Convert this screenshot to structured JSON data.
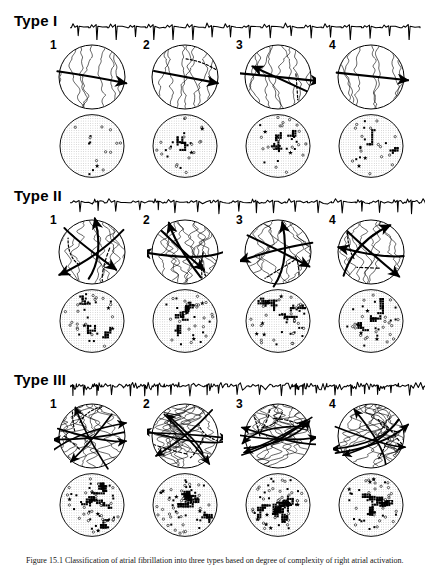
{
  "figure": {
    "caption_prefix": "Figure 15.1",
    "caption_text": "Figure 15.1  Classification of atrial fibrillation into three types based on degree of complexity of right atrial activation."
  },
  "types": [
    {
      "id": "type-1",
      "label": "Type I",
      "ecg": {
        "name": "ecg-type-1",
        "description": "regular coarse fibrillation waves, uniform morphology",
        "beats": 18,
        "amplitude": 0.85,
        "irregularity": 0.08,
        "noise": 0.05
      },
      "activation_panels": [
        {
          "number": "1",
          "pattern": "single-broad-wavefront",
          "isochrones": 7,
          "arrows": 1,
          "block_lines": 0
        },
        {
          "number": "2",
          "pattern": "single-wavefront-with-arc-of-block",
          "isochrones": 8,
          "arrows": 1,
          "block_lines": 1
        },
        {
          "number": "3",
          "pattern": "two-wavefronts-colliding",
          "isochrones": 8,
          "arrows": 2,
          "block_lines": 1
        },
        {
          "number": "4",
          "pattern": "single-uniform-wavefront",
          "isochrones": 7,
          "arrows": 1,
          "block_lines": 0
        }
      ],
      "map_panels": [
        {
          "number": "1",
          "density": 0.06,
          "clusters": 0,
          "stars": 1
        },
        {
          "number": "2",
          "density": 0.22,
          "clusters": 2,
          "stars": 2
        },
        {
          "number": "3",
          "density": 0.3,
          "clusters": 3,
          "stars": 2
        },
        {
          "number": "4",
          "density": 0.2,
          "clusters": 2,
          "stars": 2
        }
      ]
    },
    {
      "id": "type-2",
      "label": "Type II",
      "ecg": {
        "name": "ecg-type-2",
        "description": "fibrillation waves of varying morphology and cycle length",
        "beats": 20,
        "amplitude": 0.72,
        "irregularity": 0.38,
        "noise": 0.18
      },
      "activation_panels": [
        {
          "number": "1",
          "pattern": "two-wavelets-with-block-arc",
          "isochrones": 10,
          "arrows": 3,
          "block_lines": 2
        },
        {
          "number": "2",
          "pattern": "wavefront-with-reentry",
          "isochrones": 11,
          "arrows": 3,
          "block_lines": 2
        },
        {
          "number": "3",
          "pattern": "two-separate-wavelets",
          "isochrones": 11,
          "arrows": 3,
          "block_lines": 2
        },
        {
          "number": "4",
          "pattern": "wavefront-with-slow-conduction-zone",
          "isochrones": 10,
          "arrows": 3,
          "block_lines": 2
        }
      ],
      "map_panels": [
        {
          "number": "1",
          "density": 0.3,
          "clusters": 3,
          "stars": 3
        },
        {
          "number": "2",
          "density": 0.36,
          "clusters": 4,
          "stars": 3
        },
        {
          "number": "3",
          "density": 0.42,
          "clusters": 4,
          "stars": 4
        },
        {
          "number": "4",
          "density": 0.38,
          "clusters": 3,
          "stars": 3
        }
      ]
    },
    {
      "id": "type-3",
      "label": "Type III",
      "ecg": {
        "name": "ecg-type-3",
        "description": "highly fragmented fibrillation waves, no discrete baseline",
        "beats": 24,
        "amplitude": 0.6,
        "irregularity": 0.72,
        "noise": 0.45
      },
      "activation_panels": [
        {
          "number": "1",
          "pattern": "multiple-wavelets",
          "isochrones": 14,
          "arrows": 5,
          "block_lines": 3
        },
        {
          "number": "2",
          "pattern": "multiple-wavelets",
          "isochrones": 15,
          "arrows": 5,
          "block_lines": 3
        },
        {
          "number": "3",
          "pattern": "multiple-wavelets-random-reentry",
          "isochrones": 16,
          "arrows": 6,
          "block_lines": 4
        },
        {
          "number": "4",
          "pattern": "multiple-wavelets",
          "isochrones": 14,
          "arrows": 5,
          "block_lines": 3
        }
      ],
      "map_panels": [
        {
          "number": "1",
          "density": 0.52,
          "clusters": 5,
          "stars": 4
        },
        {
          "number": "2",
          "density": 0.55,
          "clusters": 5,
          "stars": 5
        },
        {
          "number": "3",
          "density": 0.58,
          "clusters": 6,
          "stars": 5
        },
        {
          "number": "4",
          "density": 0.5,
          "clusters": 5,
          "stars": 4
        }
      ]
    }
  ],
  "style": {
    "ink": "#000000",
    "stipple": "#8c8c8c",
    "paper": "#ffffff"
  }
}
